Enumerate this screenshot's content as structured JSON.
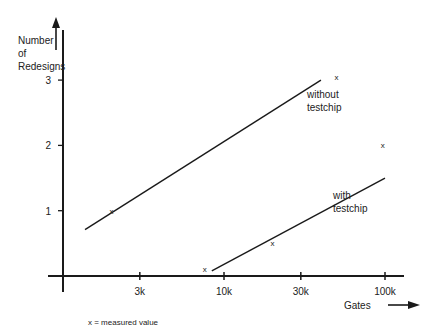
{
  "chart_data": {
    "type": "line",
    "title": "",
    "xlabel": "Gates",
    "ylabel": "Number of Redesigns",
    "ylabel_lines": [
      "Number",
      "of",
      "Redesigns"
    ],
    "xscale": "log",
    "xlim": [
      1000,
      100000
    ],
    "ylim": [
      0,
      3
    ],
    "xticks": [
      {
        "value": 3000,
        "label": "3k"
      },
      {
        "value": 10000,
        "label": "10k"
      },
      {
        "value": 30000,
        "label": "30k"
      },
      {
        "value": 100000,
        "label": "100k"
      }
    ],
    "yticks": [
      {
        "value": 1,
        "label": "1"
      },
      {
        "value": 2,
        "label": "2"
      },
      {
        "value": 3,
        "label": "3"
      }
    ],
    "grid": false,
    "series": [
      {
        "name": "without testchip",
        "label_lines": [
          "without",
          "testchip"
        ],
        "line": [
          {
            "x": 1370,
            "y": 0.71
          },
          {
            "x": 40000,
            "y": 3.0
          }
        ],
        "points": [
          {
            "x": 2000,
            "y": 1.0
          },
          {
            "x": 50000,
            "y": 3.05
          }
        ]
      },
      {
        "name": "with testchip",
        "label_lines": [
          "with",
          "testchip"
        ],
        "line": [
          {
            "x": 8400,
            "y": 0.08
          },
          {
            "x": 100000,
            "y": 1.5
          }
        ],
        "points": [
          {
            "x": 7600,
            "y": 0.1
          },
          {
            "x": 20000,
            "y": 0.5
          },
          {
            "x": 97000,
            "y": 2.0
          }
        ]
      }
    ],
    "marker_symbol": "x",
    "legend_note": "x = measured value",
    "legend": "bottom-left"
  }
}
